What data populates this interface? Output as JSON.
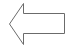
{
  "shape": {
    "type": "left-arrow",
    "stroke_color": "#6b6b6b",
    "fill_color": "#ffffff"
  }
}
